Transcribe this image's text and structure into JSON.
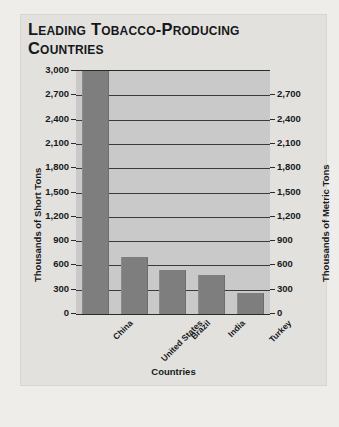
{
  "panel": {
    "title": "Leading Tobacco-Producing Countries"
  },
  "chart_data": {
    "type": "bar",
    "title": "Leading Tobacco-Producing Countries",
    "xlabel": "Countries",
    "ylabel": "Thousands of Short Tons",
    "ylabel_secondary": "Thousands of Metric Tons",
    "categories": [
      "China",
      "United States",
      "Brazil",
      "India",
      "Turkey"
    ],
    "values": [
      3000,
      700,
      540,
      480,
      260
    ],
    "ylim": [
      0,
      3000
    ],
    "ylim_secondary": [
      0,
      2700
    ],
    "yticks": [
      0,
      300,
      600,
      900,
      1200,
      1500,
      1800,
      2100,
      2400,
      2700,
      3000
    ],
    "ytick_labels": [
      "0",
      "300",
      "600",
      "900",
      "1,200",
      "1,500",
      "1,800",
      "2,100",
      "2,400",
      "2,700",
      "3,000"
    ],
    "ytick_labels_secondary": [
      "0",
      "300",
      "600",
      "900",
      "1,200",
      "1,500",
      "1,800",
      "2,100",
      "2,400",
      "2,700"
    ],
    "grid": true,
    "legend": "none",
    "series": [
      {
        "name": "Tobacco production",
        "values": [
          3000,
          700,
          540,
          480,
          260
        ]
      }
    ],
    "colors": {
      "bar": "#7f7e7f",
      "plot_background": "#c9c9c9",
      "gridline": "#3a3a3a",
      "panel_background": "#e2e1de",
      "text": "#17191b"
    }
  }
}
